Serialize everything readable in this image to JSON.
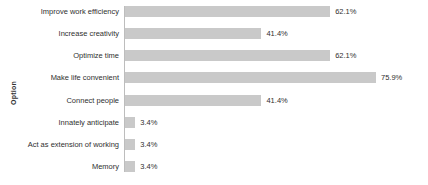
{
  "chart_data": {
    "type": "bar",
    "orientation": "horizontal",
    "title": "",
    "xlabel": "",
    "ylabel": "Option",
    "grid": false,
    "legend": null,
    "xlim": [
      0,
      75.9
    ],
    "value_suffix": "%",
    "categories": [
      "Improve work efficiency",
      "Increase creativity",
      "Optimize time",
      "Make life convenient",
      "Connect people",
      "Innately anticipate",
      "Act as extension of working",
      "Memory"
    ],
    "values": [
      62.1,
      41.4,
      62.1,
      75.9,
      41.4,
      3.4,
      3.4,
      3.4
    ],
    "value_labels": [
      "62.1%",
      "41.4%",
      "62.1%",
      "75.9%",
      "41.4%",
      "3.4%",
      "3.4%",
      "3.4%"
    ],
    "bar_color": "#c9c9c9",
    "axis_color": "#bdbdbd",
    "text_color": "#2f2f2f"
  },
  "axis": {
    "y_title": "Option"
  },
  "footer": {
    "caption": ""
  }
}
